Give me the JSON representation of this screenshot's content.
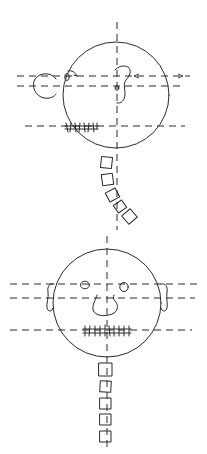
{
  "diagram": {
    "background": "#ffffff",
    "ink_color": "#2a2a2a",
    "figures": [
      {
        "name": "profile-view",
        "head": {
          "cx": 117,
          "cy": 95,
          "r": 53
        },
        "ear": {
          "cx": 46,
          "cy": 86,
          "rx": 12,
          "ry": 12
        },
        "eye": {
          "x": 66,
          "y": 77,
          "label": "0"
        },
        "nose_eye_mark": {
          "x": 117,
          "y": 88,
          "label": "o"
        },
        "vertical_axis": {
          "x": 117,
          "y1": 22,
          "y2": 230
        },
        "horizontal_axes": [
          {
            "y": 76,
            "x1": 17,
            "x2": 190
          },
          {
            "y": 86,
            "x1": 17,
            "x2": 183
          },
          {
            "y": 126,
            "x1": 25,
            "x2": 185
          }
        ],
        "teeth_label": "HHHHH",
        "vertebrae": [
          {
            "x": 101,
            "y": 157,
            "size": 11,
            "rot": 6
          },
          {
            "x": 102,
            "y": 175,
            "size": 11,
            "rot": -8
          },
          {
            "x": 107,
            "y": 191,
            "size": 11,
            "rot": -28
          },
          {
            "x": 115,
            "y": 203,
            "size": 10,
            "rot": -35
          },
          {
            "x": 125,
            "y": 212,
            "size": 11,
            "rot": -40
          }
        ]
      },
      {
        "name": "frontal-view",
        "head": {
          "cx": 107,
          "cy": 304,
          "r": 54
        },
        "ears": [
          {
            "side": "left",
            "x": 52,
            "y": 283
          },
          {
            "side": "right",
            "x": 163,
            "y": 283
          }
        ],
        "eyes": [
          {
            "cx": 85,
            "cy": 285,
            "rx": 4.5,
            "ry": 4
          },
          {
            "cx": 124,
            "cy": 287,
            "rx": 4.5,
            "ry": 4.5
          }
        ],
        "vertical_axis": {
          "x": 107,
          "y1": 235,
          "y2": 452
        },
        "horizontal_axes": [
          {
            "y": 284,
            "x1": 10,
            "x2": 200
          },
          {
            "y": 298,
            "x1": 10,
            "x2": 195
          },
          {
            "y": 330,
            "x1": 10,
            "x2": 192
          }
        ],
        "teeth_label": "HHHHHH",
        "vertebrae": [
          {
            "x": 99,
            "y": 363,
            "size": 13,
            "rot": 0
          },
          {
            "x": 100,
            "y": 381,
            "size": 11,
            "rot": 3
          },
          {
            "x": 100,
            "y": 398,
            "size": 11,
            "rot": 0
          },
          {
            "x": 100,
            "y": 414,
            "size": 11,
            "rot": 0
          },
          {
            "x": 100,
            "y": 431,
            "size": 11,
            "rot": 0
          }
        ]
      }
    ]
  }
}
